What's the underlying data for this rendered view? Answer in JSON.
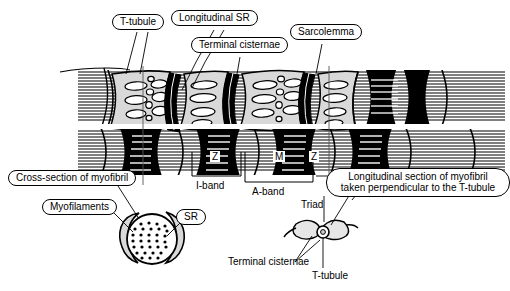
{
  "figure": {
    "colors": {
      "ink": "#000000",
      "background": "#ffffff",
      "sr_fill": "#d9d9d9",
      "sr_fill_light": "#ececec",
      "a_band": "#000000",
      "i_band": "#ffffff"
    }
  },
  "callouts": {
    "t_tubule_top": "T-tubule",
    "longitudinal_sr": "Longitudinal SR",
    "terminal_cisternae_top": "Terminal cisternae",
    "sarcolemma": "Sarcolemma",
    "cross_section": "Cross-section of myofibril",
    "myofilaments": "Myofilaments",
    "sr": "SR",
    "longitudinal_section_line1": "Longitudinal section of myofibril",
    "longitudinal_section_line2": "taken perpendicular to the T-tubule"
  },
  "band_labels": {
    "z_left": "Z",
    "m": "M",
    "z_right": "Z",
    "i_band": "I-band",
    "a_band": "A-band"
  },
  "inset_labels": {
    "triad": "Triad",
    "terminal_cisternae_bottom": "Terminal cisternae",
    "t_tubule_bottom": "T-tubule"
  }
}
